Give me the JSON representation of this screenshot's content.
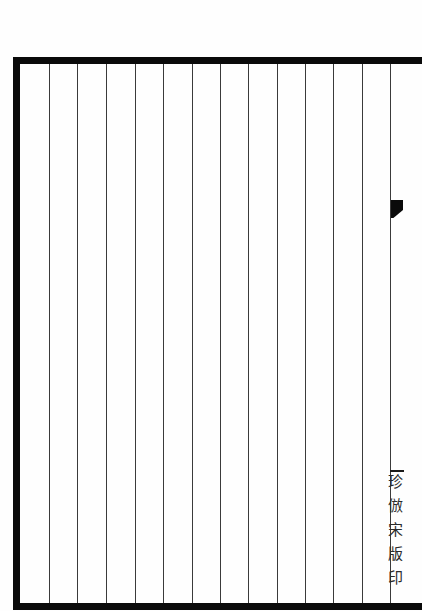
{
  "document": {
    "type": "blank ruled Chinese book page (woodblock-style)",
    "border_color": "#0a0a0a",
    "rule_color": "#3a3a3a",
    "column_rules_x": [
      49,
      77,
      106,
      135,
      163,
      192,
      220,
      248,
      277,
      305,
      333,
      362,
      390
    ],
    "fish_tail_marker": "fish-tail",
    "margin_text": "珍倣宋版印"
  }
}
